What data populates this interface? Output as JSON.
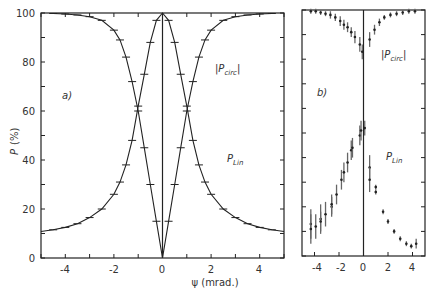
{
  "chart_data": [
    {
      "type": "line",
      "panel": "a)",
      "title": "",
      "xlabel": "ψ (mrad.)",
      "ylabel": "P (%)",
      "xlim": [
        -5,
        5
      ],
      "ylim": [
        0,
        100
      ],
      "xticks": [
        -4,
        -2,
        0,
        2,
        4
      ],
      "yticks": [
        0,
        20,
        40,
        60,
        80,
        100
      ],
      "grid": false,
      "annotations": [
        "|P_circ|",
        "P_lin",
        "a)"
      ],
      "series": [
        {
          "name": "|P_circ|",
          "x": [
            -4.5,
            -4.0,
            -3.5,
            -3.0,
            -2.5,
            -2.0,
            -1.75,
            -1.5,
            -1.25,
            -1.0,
            -0.75,
            -0.5,
            -0.25,
            0,
            0.25,
            0.5,
            0.75,
            1.0,
            1.25,
            1.5,
            1.75,
            2.0,
            2.5,
            3.0,
            3.5,
            4.0,
            4.5
          ],
          "values": [
            99.8,
            99.6,
            99.2,
            98.5,
            97,
            93,
            89,
            82,
            72,
            60,
            45,
            30,
            15,
            0,
            15,
            30,
            45,
            60,
            72,
            82,
            89,
            93,
            97,
            98.5,
            99.2,
            99.6,
            99.8
          ]
        },
        {
          "name": "P_lin",
          "x": [
            -5.0,
            -4.5,
            -4.0,
            -3.5,
            -3.0,
            -2.5,
            -2.0,
            -1.75,
            -1.5,
            -1.25,
            -1.0,
            -0.75,
            -0.5,
            -0.25,
            0,
            0.25,
            0.5,
            0.75,
            1.0,
            1.25,
            1.5,
            1.75,
            2.0,
            2.5,
            3.0,
            3.5,
            4.0,
            4.5,
            5.0
          ],
          "values": [
            10.8,
            11.5,
            12.5,
            14,
            16.5,
            20,
            26,
            31,
            38,
            48,
            62,
            75,
            88,
            97,
            100,
            97,
            88,
            75,
            62,
            48,
            38,
            31,
            26,
            20,
            16.5,
            14,
            12.5,
            11.5,
            10.8
          ]
        }
      ]
    },
    {
      "type": "scatter",
      "panel": "b)",
      "title": "",
      "xlabel": "",
      "ylabel": "",
      "xlim": [
        -5,
        5
      ],
      "ylim": [
        0,
        100
      ],
      "xticks": [
        -4,
        -2,
        0,
        2,
        4
      ],
      "yticks": [
        0,
        10,
        20,
        30,
        40,
        50,
        60,
        70,
        80,
        90,
        100
      ],
      "grid": false,
      "annotations": [
        "|P_circ|",
        "P_lin",
        "b)"
      ],
      "series": [
        {
          "name": "|P_circ|",
          "x": [
            -4.3,
            -3.9,
            -3.5,
            -3.1,
            -2.7,
            -2.3,
            -1.9,
            -1.6,
            -1.3,
            -1.0,
            -0.7,
            -0.3,
            -0.1,
            0.5,
            0.9,
            1.3,
            1.7,
            2.2,
            2.7,
            3.2,
            3.7,
            4.2
          ],
          "values": [
            99.5,
            99.5,
            99,
            98.5,
            98,
            97,
            95.5,
            94,
            93,
            91,
            89,
            86,
            83,
            88,
            92,
            95,
            97,
            98,
            98.5,
            99,
            99.5,
            99.5
          ],
          "errors": [
            1,
            1,
            1,
            1,
            1.5,
            1.5,
            2,
            2,
            2,
            2,
            2.5,
            3,
            3,
            3,
            2,
            1.5,
            1,
            1,
            1,
            1,
            1,
            1
          ]
        },
        {
          "name": "P_lin",
          "x": [
            -4.3,
            -4.3,
            -3.9,
            -3.5,
            -3.5,
            -3.1,
            -2.6,
            -2.6,
            -2.2,
            -1.8,
            -1.6,
            -1.3,
            -1.0,
            -0.9,
            -0.3,
            -0.2,
            0.1,
            0.5,
            0.5,
            1.0,
            1.0,
            1.6,
            2.0,
            2.5,
            3.0,
            3.5,
            3.9,
            4.3
          ],
          "values": [
            13,
            11,
            12,
            15,
            14,
            17,
            20,
            21,
            25,
            31,
            34,
            38,
            43,
            44,
            49,
            51,
            52,
            36,
            31,
            28,
            26,
            18,
            14,
            10,
            7,
            5,
            4,
            5
          ],
          "errors": [
            6,
            6,
            5,
            6,
            4,
            5,
            4,
            4,
            4,
            4,
            4,
            4,
            4,
            4,
            4,
            4,
            3,
            5,
            5,
            1,
            1,
            1,
            1,
            1,
            1,
            1,
            1,
            2
          ]
        }
      ]
    }
  ],
  "panel_a": {
    "label": "a)",
    "ylabel_main": "P",
    "ylabel_unit": "(%)",
    "xlabel": "ψ (mrad.)",
    "ytick_labels": [
      "0",
      "20",
      "40",
      "60",
      "80",
      "100"
    ],
    "xtick_labels": [
      "-4",
      "-2",
      "0",
      "2",
      "4"
    ],
    "circ_label_main": "|P",
    "circ_label_sub": "circ",
    "circ_label_end": "|",
    "lin_label_main": "P",
    "lin_label_sub": "Lin"
  },
  "panel_b": {
    "label": "b)",
    "xtick_labels": [
      "-4",
      "-2",
      "0",
      "2",
      "4"
    ],
    "circ_label_main": "|P",
    "circ_label_sub": "circ",
    "circ_label_end": "|",
    "lin_label_main": "P",
    "lin_label_sub": "Lin"
  }
}
